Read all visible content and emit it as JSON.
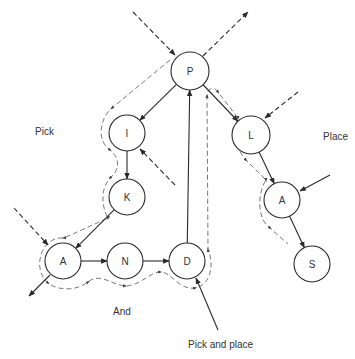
{
  "diagram": {
    "type": "tree-traversal",
    "nodes": [
      {
        "id": "P",
        "label": "P",
        "x": 190,
        "y": 71,
        "r": 19
      },
      {
        "id": "I",
        "label": "I",
        "x": 127,
        "y": 133,
        "r": 18
      },
      {
        "id": "K",
        "label": "K",
        "x": 127,
        "y": 197,
        "r": 18
      },
      {
        "id": "A1",
        "label": "A",
        "x": 63,
        "y": 261,
        "r": 18
      },
      {
        "id": "N",
        "label": "N",
        "x": 125,
        "y": 261,
        "r": 18
      },
      {
        "id": "D",
        "label": "D",
        "x": 187,
        "y": 261,
        "r": 18
      },
      {
        "id": "L",
        "label": "L",
        "x": 251,
        "y": 135,
        "r": 19
      },
      {
        "id": "A2",
        "label": "A",
        "x": 282,
        "y": 200,
        "r": 18
      },
      {
        "id": "S",
        "label": "S",
        "x": 312,
        "y": 264,
        "r": 18
      }
    ],
    "edges": [
      {
        "from": "P",
        "to": "I"
      },
      {
        "from": "P",
        "to": "L"
      },
      {
        "from": "I",
        "to": "K"
      },
      {
        "from": "K",
        "to": "A1"
      },
      {
        "from": "A1",
        "to": "N"
      },
      {
        "from": "N",
        "to": "D"
      },
      {
        "from": "D",
        "to": "P"
      },
      {
        "from": "L",
        "to": "A2"
      },
      {
        "from": "A2",
        "to": "S"
      }
    ],
    "external_arrows": [
      {
        "x1": 133,
        "y1": 12,
        "x2": 175,
        "y2": 55,
        "style": "dashed",
        "desc": "into P"
      },
      {
        "x1": 203,
        "y1": 56,
        "x2": 248,
        "y2": 12,
        "style": "dashed",
        "desc": "out of P"
      },
      {
        "x1": 175,
        "y1": 185,
        "x2": 140,
        "y2": 149,
        "style": "dashed",
        "desc": "into I"
      },
      {
        "x1": 14,
        "y1": 208,
        "x2": 48,
        "y2": 245,
        "style": "dashed",
        "desc": "into A (left)"
      },
      {
        "x1": 50,
        "y1": 275,
        "x2": 29,
        "y2": 296,
        "style": "solid",
        "desc": "out of A (left)"
      },
      {
        "x1": 218,
        "y1": 330,
        "x2": 196,
        "y2": 278,
        "style": "solid",
        "desc": "into D"
      },
      {
        "x1": 298,
        "y1": 92,
        "x2": 265,
        "y2": 118,
        "style": "dashed",
        "desc": "into L"
      },
      {
        "x1": 330,
        "y1": 175,
        "x2": 300,
        "y2": 191,
        "style": "solid",
        "desc": "into A (right)"
      }
    ],
    "labels": [
      {
        "text": "Pick",
        "x": 35,
        "y": 135
      },
      {
        "text": "Place",
        "x": 323,
        "y": 140
      },
      {
        "text": "And",
        "x": 113,
        "y": 315
      },
      {
        "text": "Pick and place",
        "x": 188,
        "y": 348
      }
    ]
  }
}
